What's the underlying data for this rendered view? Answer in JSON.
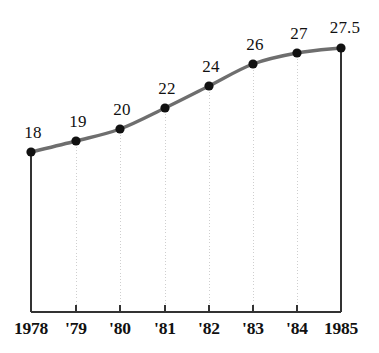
{
  "chart_data": {
    "type": "line",
    "title": "",
    "subtitle": "",
    "xlabel": "",
    "ylabel": "",
    "grid": "vertical-dotted",
    "legend": "none",
    "categories": [
      "1978",
      "'79",
      "'80",
      "'81",
      "'82",
      "'83",
      "'84",
      "1985"
    ],
    "values": [
      18,
      19,
      20,
      22,
      24,
      26,
      27,
      27.5
    ],
    "point_labels": [
      "18",
      "19",
      "20",
      "22",
      "24",
      "26",
      "27",
      "27.5"
    ],
    "xlim": [
      1978,
      1985
    ],
    "ylim": [
      0,
      30
    ],
    "axis_ticks_visible": true,
    "marker": "filled-circle",
    "points": [
      {
        "label": "1978",
        "value": 18,
        "text": "18",
        "x": 31,
        "y": 152,
        "label_x": 33,
        "label_y": 124
      },
      {
        "label": "'79",
        "value": 19,
        "text": "19",
        "x": 76,
        "y": 141,
        "label_x": 78,
        "label_y": 113
      },
      {
        "label": "'80",
        "value": 20,
        "text": "20",
        "x": 120,
        "y": 129,
        "label_x": 122,
        "label_y": 101
      },
      {
        "label": "'81",
        "value": 22,
        "text": "22",
        "x": 165,
        "y": 108,
        "label_x": 167,
        "label_y": 80
      },
      {
        "label": "'82",
        "value": 24,
        "text": "24",
        "x": 209,
        "y": 86,
        "label_x": 211,
        "label_y": 58
      },
      {
        "label": "'83",
        "value": 26,
        "text": "26",
        "x": 253,
        "y": 64,
        "label_x": 255,
        "label_y": 36
      },
      {
        "label": "'84",
        "value": 27,
        "text": "27",
        "x": 297,
        "y": 53,
        "label_x": 299,
        "label_y": 25
      },
      {
        "label": "1985",
        "value": 27.5,
        "text": "27.5",
        "x": 341,
        "y": 48,
        "label_x": 345,
        "label_y": 19
      }
    ],
    "colors": {
      "line": "#6e6e6e",
      "marker": "#111111",
      "axis": "#333333",
      "grid": "#cfcfcf",
      "text": "#111111",
      "background": "#ffffff"
    },
    "geometry": {
      "plot_left": 31,
      "plot_right": 341,
      "plot_bottom": 312,
      "tick_length": 7,
      "axis_label_y": 320,
      "line_width": 3.4,
      "marker_radius": 4.6
    }
  }
}
